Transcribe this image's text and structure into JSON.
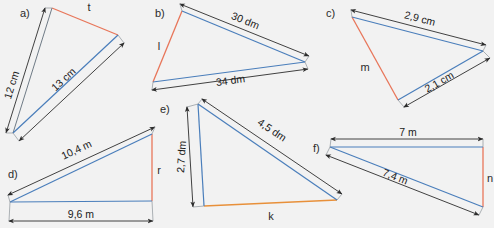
{
  "figure": {
    "background_color": "#f2f2f2",
    "colors": {
      "blue_side": "#4a7ebb",
      "red_side": "#e8765a",
      "orange_side": "#e8903a",
      "dimension_line": "#3a3a3a",
      "thin_outline": "#6f7b86",
      "text": "#1f1f1f"
    }
  },
  "panels": [
    {
      "id": "a",
      "letter": "a)",
      "unknown_side_label": "t",
      "unknown_side_color": "#e8765a",
      "dimensions": [
        {
          "value": "12 cm"
        },
        {
          "value": "13 cm"
        }
      ]
    },
    {
      "id": "b",
      "letter": "b)",
      "unknown_side_label": "l",
      "unknown_side_color": "#e8765a",
      "dimensions": [
        {
          "value": "30 dm"
        },
        {
          "value": "34 dm"
        }
      ]
    },
    {
      "id": "c",
      "letter": "c)",
      "unknown_side_label": "m",
      "unknown_side_color": "#e8765a",
      "dimensions": [
        {
          "value": "2,9 cm"
        },
        {
          "value": "2,1 cm"
        }
      ]
    },
    {
      "id": "d",
      "letter": "d)",
      "unknown_side_label": "r",
      "unknown_side_color": "#e8765a",
      "dimensions": [
        {
          "value": "10,4 m"
        },
        {
          "value": "9,6 m"
        }
      ]
    },
    {
      "id": "e",
      "letter": "e)",
      "unknown_side_label": "k",
      "unknown_side_color": "#e8903a",
      "dimensions": [
        {
          "value": "2,7 dm"
        },
        {
          "value": "4,5 dm"
        }
      ]
    },
    {
      "id": "f",
      "letter": "f)",
      "unknown_side_label": "n",
      "unknown_side_color": "#e8765a",
      "dimensions": [
        {
          "value": "7 m"
        },
        {
          "value": "7,4 m"
        }
      ]
    }
  ],
  "labels": {
    "a_letter": "a)",
    "a_t": "t",
    "a_d1": "12 cm",
    "a_d2": "13 cm",
    "b_letter": "b)",
    "b_l": "l",
    "b_d1": "30 dm",
    "b_d2": "34 dm",
    "c_letter": "c)",
    "c_m": "m",
    "c_d1": "2,9 cm",
    "c_d2": "2,1 cm",
    "d_letter": "d)",
    "d_r": "r",
    "d_d1": "10,4 m",
    "d_d2": "9,6 m",
    "e_letter": "e)",
    "e_k": "k",
    "e_d1": "2,7 dm",
    "e_d2": "4,5 dm",
    "f_letter": "f)",
    "f_n": "n",
    "f_d1": "7 m",
    "f_d2": "7,4 m"
  }
}
